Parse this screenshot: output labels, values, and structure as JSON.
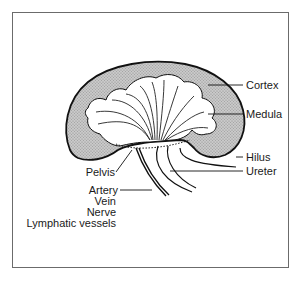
{
  "diagram": {
    "colors": {
      "frame": "#6b6b6b",
      "outline": "#111111",
      "cortex_fill": "#bdbdbd",
      "medulla_fill": "#ffffff",
      "text": "#1a1a1a"
    },
    "labels": {
      "cortex": "Cortex",
      "medula": "Medula",
      "hilus": "Hilus",
      "ureter": "Ureter",
      "pelvis": "Pelvis",
      "artery": "Artery",
      "vein": "Vein",
      "nerve": "Nerve",
      "lymphatic_vessels": "Lymphatic vessels"
    }
  }
}
